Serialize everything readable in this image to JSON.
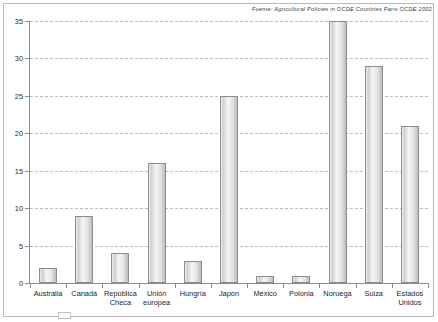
{
  "source_note": "Fuente: Agricultural Policies in OCDE Countries  Paris  OCDE  2002",
  "legend": {
    "label": ""
  },
  "chart_data": {
    "type": "bar",
    "title": "",
    "subtitle": "",
    "xlabel": "",
    "ylabel": "",
    "ylim": [
      0,
      35
    ],
    "yticks": [
      0,
      5,
      10,
      15,
      20,
      25,
      30,
      35
    ],
    "ytick_labels": [
      "0",
      "5",
      "10",
      "15",
      "20",
      "25",
      "30",
      "35"
    ],
    "grid": true,
    "legend_position": "bottom-left",
    "categories": [
      "Australia",
      "Canadá",
      "República\nCheca",
      "Unión\neuropea",
      "Hungría",
      "Japón",
      "México",
      "Polonia",
      "Noruega",
      "Suiza",
      "Estados\nUnidos"
    ],
    "values": [
      2,
      9,
      4,
      16,
      3,
      25,
      1,
      1,
      35,
      29,
      21
    ],
    "series": [
      {
        "name": "",
        "values": [
          2,
          9,
          4,
          16,
          3,
          25,
          1,
          1,
          35,
          29,
          21
        ]
      }
    ],
    "colors": {
      "bar_fill": "#e3e3e3",
      "bar_edge": "#8d8d8d",
      "grid": "#9aa7b5",
      "axis": "#8c8c8c",
      "text": "#1d1d1d",
      "background": "#ffffff"
    }
  }
}
